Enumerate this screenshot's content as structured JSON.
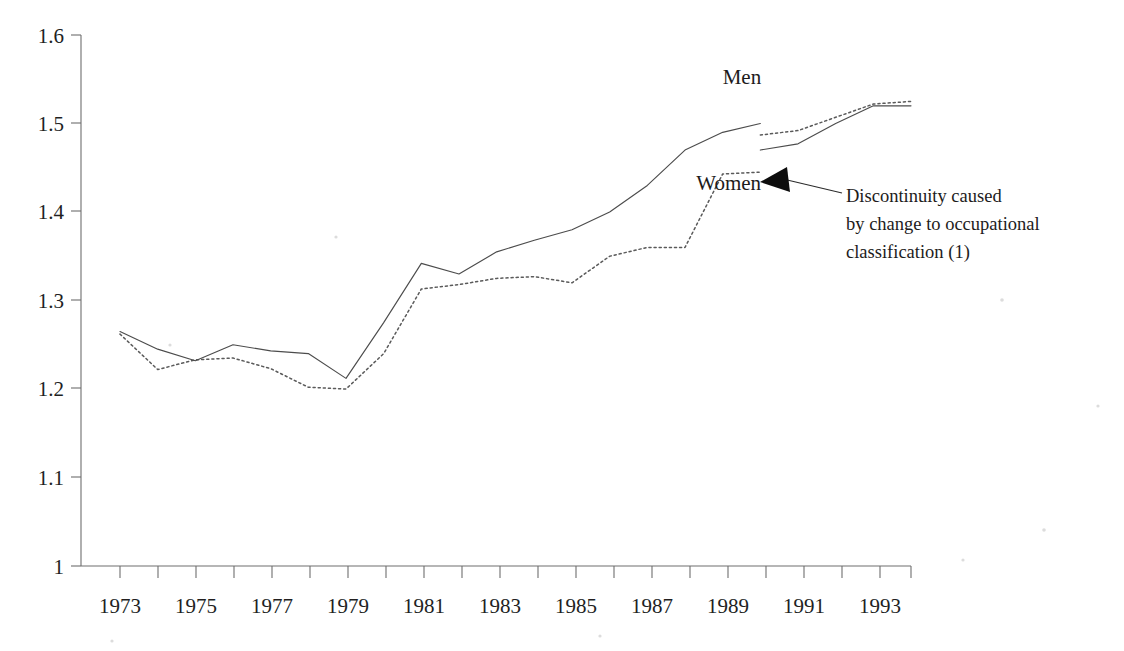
{
  "chart_data": {
    "type": "line",
    "title": "",
    "subtitle": "",
    "xlabel": "",
    "ylabel": "",
    "xlim": [
      1973,
      1994
    ],
    "ylim": [
      1.0,
      1.6
    ],
    "grid": false,
    "legend_position": "inline-labels",
    "y_ticks": [
      "1",
      "1.1",
      "1.2",
      "1.3",
      "1.4",
      "1.5",
      "1.6"
    ],
    "y_tick_values": [
      1.0,
      1.1,
      1.2,
      1.3,
      1.4,
      1.5,
      1.6
    ],
    "x_ticks": [
      "1973",
      "1975",
      "1977",
      "1979",
      "1981",
      "1983",
      "1985",
      "1987",
      "1989",
      "1991",
      "1993"
    ],
    "x_tick_values": [
      1973,
      1975,
      1977,
      1979,
      1981,
      1983,
      1985,
      1987,
      1989,
      1991,
      1993
    ],
    "x_all_tick_values": [
      1973,
      1974,
      1975,
      1976,
      1977,
      1978,
      1979,
      1980,
      1981,
      1982,
      1983,
      1984,
      1985,
      1986,
      1987,
      1988,
      1989,
      1990,
      1991,
      1992,
      1993,
      1994
    ],
    "series": [
      {
        "name": "Men",
        "style": "solid",
        "color": "#4c4c4c",
        "x": [
          1973,
          1974,
          1975,
          1976,
          1977,
          1978,
          1979,
          1980,
          1981,
          1982,
          1983,
          1984,
          1985,
          1986,
          1987,
          1988,
          1989,
          1990
        ],
        "values": [
          1.265,
          1.245,
          1.232,
          1.25,
          1.243,
          1.24,
          1.212,
          1.275,
          1.342,
          1.33,
          1.355,
          1.368,
          1.38,
          1.4,
          1.43,
          1.47,
          1.49,
          1.5
        ]
      },
      {
        "name": "Men",
        "style": "solid",
        "color": "#4c4c4c",
        "segment": "post-discontinuity",
        "x": [
          1990,
          1991,
          1992,
          1993,
          1994
        ],
        "values": [
          1.47,
          1.477,
          1.5,
          1.52,
          1.52
        ]
      },
      {
        "name": "Women",
        "style": "dotted",
        "color": "#5a5a5a",
        "x": [
          1973,
          1974,
          1975,
          1976,
          1977,
          1978,
          1979,
          1980,
          1981,
          1982,
          1983,
          1984,
          1985,
          1986,
          1987,
          1988,
          1989,
          1990
        ],
        "values": [
          1.262,
          1.222,
          1.233,
          1.235,
          1.223,
          1.202,
          1.2,
          1.24,
          1.313,
          1.318,
          1.325,
          1.327,
          1.32,
          1.35,
          1.36,
          1.36,
          1.443,
          1.445
        ]
      },
      {
        "name": "Women",
        "style": "dotted",
        "color": "#5a5a5a",
        "segment": "post-discontinuity",
        "x": [
          1990,
          1991,
          1992,
          1993,
          1994
        ],
        "values": [
          1.487,
          1.492,
          1.507,
          1.522,
          1.525
        ]
      }
    ],
    "series_labels": [
      {
        "text": "Men",
        "x": 1989.0,
        "y": 1.545
      },
      {
        "text": "Women",
        "x": 1988.3,
        "y": 1.425
      }
    ],
    "annotations": [
      {
        "id": "discontinuity-note",
        "lines": [
          "Discontinuity caused",
          "by change to occupational",
          "classification (1)"
        ],
        "points_to_x": 1990.0,
        "points_to_y": 1.455
      }
    ]
  },
  "labels": {
    "series_men": "Men",
    "series_women": "Women",
    "annotation_line_1": "Discontinuity caused",
    "annotation_line_2": "by change to occupational",
    "annotation_line_3": "classification (1)"
  },
  "y_tick_labels": {
    "t0": "1",
    "t1": "1.1",
    "t2": "1.2",
    "t3": "1.3",
    "t4": "1.4",
    "t5": "1.5",
    "t6": "1.6"
  },
  "x_tick_labels": {
    "t1973": "1973",
    "t1975": "1975",
    "t1977": "1977",
    "t1979": "1979",
    "t1981": "1981",
    "t1983": "1983",
    "t1985": "1985",
    "t1987": "1987",
    "t1989": "1989",
    "t1991": "1991",
    "t1993": "1993"
  },
  "colors": {
    "background": "#ffffff",
    "axis": "#6e6e6e",
    "men_line": "#4c4c4c",
    "women_line": "#5a5a5a",
    "text": "#1d1b1b",
    "arrow": "#0d0d0d"
  }
}
